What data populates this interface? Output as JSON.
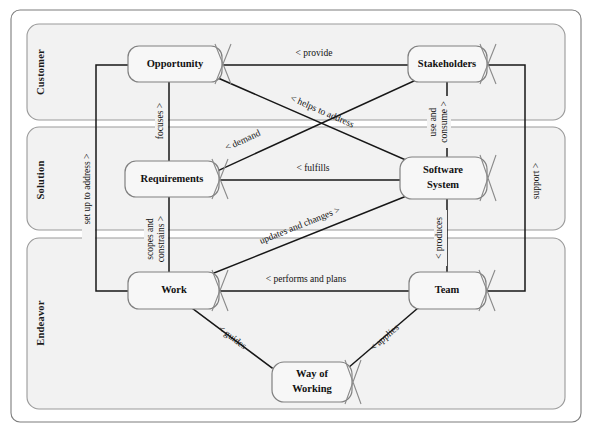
{
  "diagram": {
    "type": "entity-relationship",
    "colors": {
      "lane_fill": "#f2f2f2",
      "lane_stroke": "#9a9a9a",
      "node_fill": "#f7f7f7",
      "node_stroke": "#808080",
      "line": "#171717",
      "text": "#111111",
      "background": "#ffffff"
    },
    "lanes": [
      {
        "id": "customer",
        "label": "Customer"
      },
      {
        "id": "solution",
        "label": "Solution"
      },
      {
        "id": "endeavor",
        "label": "Endeavor"
      }
    ],
    "nodes": [
      {
        "id": "opportunity",
        "label": "Opportunity",
        "lines": [
          "Opportunity"
        ],
        "lane": "customer"
      },
      {
        "id": "stakeholders",
        "label": "Stakeholders",
        "lines": [
          "Stakeholders"
        ],
        "lane": "customer"
      },
      {
        "id": "requirements",
        "label": "Requirements",
        "lines": [
          "Requirements"
        ],
        "lane": "solution"
      },
      {
        "id": "software-system",
        "label": "Software System",
        "lines": [
          "Software",
          "System"
        ],
        "lane": "solution"
      },
      {
        "id": "work",
        "label": "Work",
        "lines": [
          "Work"
        ],
        "lane": "endeavor"
      },
      {
        "id": "team",
        "label": "Team",
        "lines": [
          "Team"
        ],
        "lane": "endeavor"
      },
      {
        "id": "way-of-working",
        "label": "Way of Working",
        "lines": [
          "Way of",
          "Working"
        ],
        "lane": "endeavor"
      }
    ],
    "relationships": [
      {
        "id": "provide",
        "label": "< provide",
        "from": "stakeholders",
        "to": "opportunity"
      },
      {
        "id": "helps-to-address",
        "label": "< helps to address",
        "from": "software-system",
        "to": "opportunity"
      },
      {
        "id": "focuses",
        "label": "focuses >",
        "from": "opportunity",
        "to": "requirements"
      },
      {
        "id": "demand",
        "label": "< demand",
        "from": "stakeholders",
        "to": "requirements"
      },
      {
        "id": "fulfills",
        "label": "< fulfills",
        "from": "software-system",
        "to": "requirements"
      },
      {
        "id": "use-and-consume",
        "label": "use and consume >",
        "from": "stakeholders",
        "to": "software-system"
      },
      {
        "id": "scopes-and-constrains",
        "label": "scopes and constrains >",
        "from": "requirements",
        "to": "work"
      },
      {
        "id": "updates-and-changes",
        "label": "updates and changes >",
        "from": "work",
        "to": "software-system"
      },
      {
        "id": "performs-and-plans",
        "label": "< performs and plans",
        "from": "team",
        "to": "work"
      },
      {
        "id": "produces",
        "label": "< produces",
        "from": "team",
        "to": "software-system"
      },
      {
        "id": "set-up-to-address",
        "label": "set up to address >",
        "from": "work",
        "to": "opportunity"
      },
      {
        "id": "support",
        "label": "support >",
        "from": "team",
        "to": "stakeholders"
      },
      {
        "id": "guides",
        "label": "< guides",
        "from": "way-of-working",
        "to": "work"
      },
      {
        "id": "applies",
        "label": "< applies",
        "from": "team",
        "to": "way-of-working"
      }
    ]
  }
}
